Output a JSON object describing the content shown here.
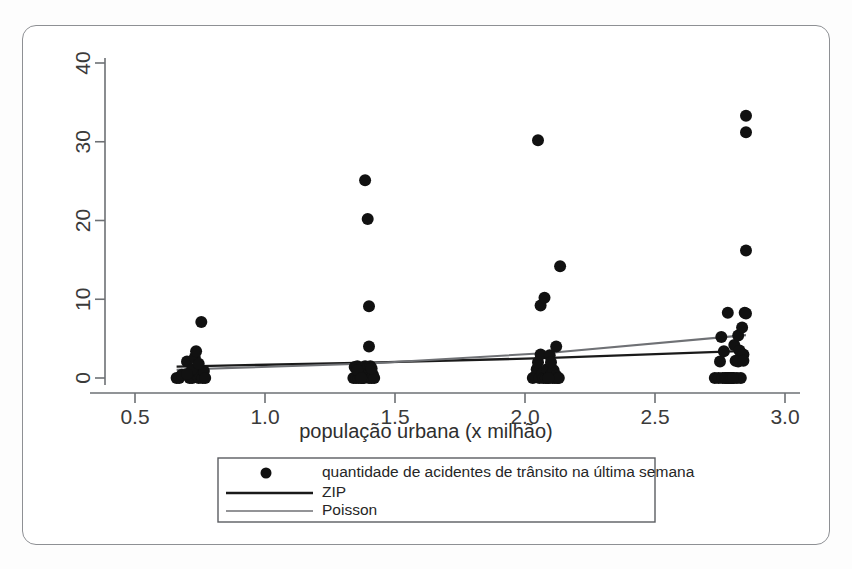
{
  "figure": {
    "background": "#ffffff",
    "frame_color": "#8e9094"
  },
  "axis": {
    "x_title": "população urbana (x milhão)",
    "y_title": "",
    "x_ticks": [
      "0.5",
      "1.0",
      "1.5",
      "2.0",
      "2.5",
      "3.0"
    ],
    "y_ticks": [
      "0",
      "10",
      "20",
      "30",
      "40"
    ]
  },
  "legend": {
    "items": [
      {
        "label": "quantidade de acidentes de trânsito na última semana",
        "marker": "dot",
        "color": "#111111"
      },
      {
        "label": "ZIP",
        "marker": "line",
        "color": "#1a1a1a"
      },
      {
        "label": "Poisson",
        "marker": "line",
        "color": "#6f7175"
      }
    ]
  },
  "chart_data": {
    "type": "scatter",
    "title": "",
    "xlabel": "população urbana (x milhão)",
    "ylabel": "",
    "xlim": [
      0.42,
      3.02
    ],
    "ylim": [
      -1.2,
      42
    ],
    "xticks": [
      0.5,
      1.0,
      1.5,
      2.0,
      2.5,
      3.0
    ],
    "yticks": [
      0,
      10,
      20,
      30,
      40
    ],
    "grid": false,
    "legend_position": "below-axes",
    "series": [
      {
        "name": "quantidade de acidentes de trânsito na última semana",
        "type": "scatter",
        "color": "#111111",
        "marker_size": 9,
        "points": [
          [
            0.66,
            0.0
          ],
          [
            0.67,
            0.0
          ],
          [
            0.68,
            0.4
          ],
          [
            0.7,
            2.1
          ],
          [
            0.71,
            0.0
          ],
          [
            0.72,
            0.0
          ],
          [
            0.73,
            2.6
          ],
          [
            0.735,
            3.4
          ],
          [
            0.74,
            1.0
          ],
          [
            0.745,
            0.0
          ],
          [
            0.75,
            0.4
          ],
          [
            0.755,
            7.1
          ],
          [
            0.76,
            0.0
          ],
          [
            0.765,
            0.9
          ],
          [
            0.77,
            0.0
          ],
          [
            0.72,
            1.1
          ],
          [
            0.7,
            0.5
          ],
          [
            0.745,
            1.8
          ],
          [
            1.34,
            0.0
          ],
          [
            1.345,
            1.4
          ],
          [
            1.35,
            0.0
          ],
          [
            1.355,
            1.5
          ],
          [
            1.36,
            0.0
          ],
          [
            1.365,
            0.3
          ],
          [
            1.37,
            1.3
          ],
          [
            1.375,
            0.0
          ],
          [
            1.38,
            0.0
          ],
          [
            1.385,
            1.5
          ],
          [
            1.39,
            0.2
          ],
          [
            1.395,
            1.4
          ],
          [
            1.4,
            0.0
          ],
          [
            1.405,
            1.5
          ],
          [
            1.41,
            0.0
          ],
          [
            1.415,
            0.4
          ],
          [
            1.42,
            0.0
          ],
          [
            1.4,
            4.0
          ],
          [
            1.4,
            9.1
          ],
          [
            1.395,
            20.2
          ],
          [
            1.385,
            25.1
          ],
          [
            1.355,
            1.0
          ],
          [
            1.37,
            0.0
          ],
          [
            1.41,
            1.2
          ],
          [
            2.03,
            0.0
          ],
          [
            2.04,
            0.2
          ],
          [
            2.045,
            1.1
          ],
          [
            2.05,
            2.0
          ],
          [
            2.05,
            30.2
          ],
          [
            2.055,
            0.0
          ],
          [
            2.06,
            3.0
          ],
          [
            2.065,
            0.5
          ],
          [
            2.07,
            0.0
          ],
          [
            2.08,
            0.0
          ],
          [
            2.085,
            1.1
          ],
          [
            2.09,
            0.0
          ],
          [
            2.095,
            2.9
          ],
          [
            2.1,
            0.4
          ],
          [
            2.105,
            0.0
          ],
          [
            2.11,
            1.0
          ],
          [
            2.115,
            0.0
          ],
          [
            2.12,
            0.3
          ],
          [
            2.12,
            4.0
          ],
          [
            2.125,
            0.0
          ],
          [
            2.13,
            0.0
          ],
          [
            2.135,
            14.2
          ],
          [
            2.06,
            9.2
          ],
          [
            2.075,
            10.2
          ],
          [
            2.1,
            2.0
          ],
          [
            2.09,
            0.0
          ],
          [
            2.73,
            0.0
          ],
          [
            2.745,
            0.0
          ],
          [
            2.75,
            2.1
          ],
          [
            2.755,
            5.2
          ],
          [
            2.76,
            0.0
          ],
          [
            2.765,
            3.4
          ],
          [
            2.77,
            0.0
          ],
          [
            2.775,
            0.0
          ],
          [
            2.78,
            0.0
          ],
          [
            2.785,
            0.0
          ],
          [
            2.79,
            0.0
          ],
          [
            2.795,
            0.0
          ],
          [
            2.8,
            0.0
          ],
          [
            2.805,
            4.2
          ],
          [
            2.81,
            2.2
          ],
          [
            2.815,
            0.0
          ],
          [
            2.82,
            5.4
          ],
          [
            2.825,
            3.5
          ],
          [
            2.83,
            0.0
          ],
          [
            2.835,
            6.4
          ],
          [
            2.84,
            3.0
          ],
          [
            2.845,
            8.3
          ],
          [
            2.85,
            8.2
          ],
          [
            2.85,
            16.2
          ],
          [
            2.85,
            31.2
          ],
          [
            2.85,
            33.3
          ],
          [
            2.78,
            8.3
          ],
          [
            2.82,
            2.1
          ],
          [
            2.84,
            2.2
          ],
          [
            2.8,
            0.0
          ]
        ]
      },
      {
        "name": "ZIP",
        "type": "line",
        "color": "#1a1a1a",
        "points": [
          [
            0.66,
            1.45
          ],
          [
            1.4,
            1.95
          ],
          [
            2.1,
            2.55
          ],
          [
            2.85,
            3.45
          ]
        ]
      },
      {
        "name": "Poisson",
        "type": "line",
        "color": "#6f7175",
        "points": [
          [
            0.66,
            1.05
          ],
          [
            1.4,
            1.85
          ],
          [
            2.1,
            3.2
          ],
          [
            2.85,
            5.45
          ]
        ]
      }
    ]
  }
}
